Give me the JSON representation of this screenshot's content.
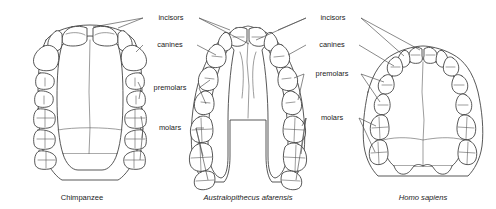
{
  "figure": {
    "background_color": "#ffffff",
    "line_color": "#3a3a3a",
    "text_color": "#1a1a1a"
  },
  "specimens": [
    {
      "id": "chimpanzee",
      "caption": "Chimpanzee",
      "italic": false,
      "arch_shape": "U-shaped with parallel tooth rows",
      "caption_x": 82,
      "caption_y": 200
    },
    {
      "id": "australopithecus-afarensis",
      "caption": "Australopithecus afarensis",
      "italic": true,
      "arch_shape": "V-shaped, flaring posteriorly",
      "caption_x": 248,
      "caption_y": 200
    },
    {
      "id": "homo-sapiens",
      "caption": "Homo sapiens",
      "italic": true,
      "arch_shape": "Rounded parabolic arch",
      "caption_x": 423,
      "caption_y": 200
    }
  ],
  "labels_left": {
    "incisors": "incisors",
    "canines": "canines",
    "premolars": "premolars",
    "molars": "molars",
    "incisors_x": 171,
    "incisors_y": 20,
    "canines_x": 171,
    "canines_y": 47,
    "premolars_x": 170,
    "premolars_y": 90,
    "molars_x": 171,
    "molars_y": 130
  },
  "labels_right": {
    "incisors": "incisors",
    "canines": "canines",
    "premolars": "premolars",
    "molars": "molars",
    "incisors_x": 333,
    "incisors_y": 20,
    "canines_x": 333,
    "canines_y": 47,
    "premolars_x": 332,
    "premolars_y": 76,
    "molars_x": 333,
    "molars_y": 120
  },
  "tooth_classes": [
    "incisors",
    "canines",
    "premolars",
    "molars"
  ]
}
